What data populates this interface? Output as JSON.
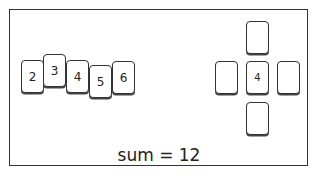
{
  "hand": {
    "cards": [
      {
        "value": "2"
      },
      {
        "value": "3"
      },
      {
        "value": "4"
      },
      {
        "value": "5"
      },
      {
        "value": "6"
      }
    ]
  },
  "cross": {
    "top": "",
    "left": "",
    "center": "4",
    "right": "",
    "bottom": ""
  },
  "status": {
    "sum_text": "sum = 12"
  }
}
